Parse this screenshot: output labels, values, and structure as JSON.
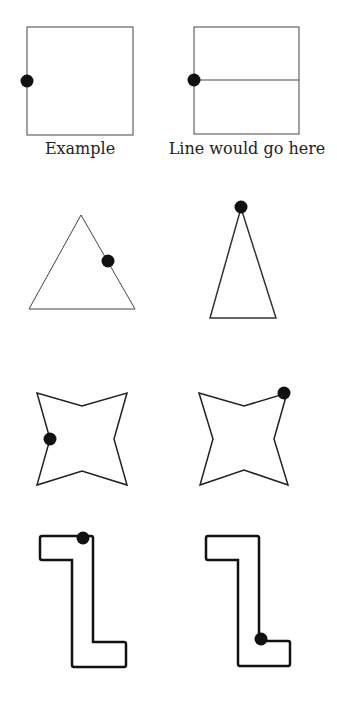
{
  "captions": {
    "example": "Example",
    "line_here": "Line would go here"
  },
  "colors": {
    "stroke": "#333333",
    "dot": "#111111",
    "background": "#ffffff"
  },
  "figures": [
    {
      "name": "square-example",
      "shape": "square",
      "dot": "left-middle"
    },
    {
      "name": "square-with-line",
      "shape": "square",
      "dot": "left-middle",
      "line": "horizontal-through-dot"
    },
    {
      "name": "triangle-equilateral",
      "shape": "triangle",
      "dot": "right-side"
    },
    {
      "name": "triangle-tall",
      "shape": "isosceles triangle",
      "dot": "apex"
    },
    {
      "name": "star-left",
      "shape": "four-point star",
      "dot": "left-edge"
    },
    {
      "name": "star-right",
      "shape": "four-point star",
      "dot": "top-right-corner"
    },
    {
      "name": "z-shape-left",
      "shape": "z-shape",
      "dot": "top-edge"
    },
    {
      "name": "z-shape-right",
      "shape": "z-shape",
      "dot": "inner-bottom-corner"
    }
  ]
}
